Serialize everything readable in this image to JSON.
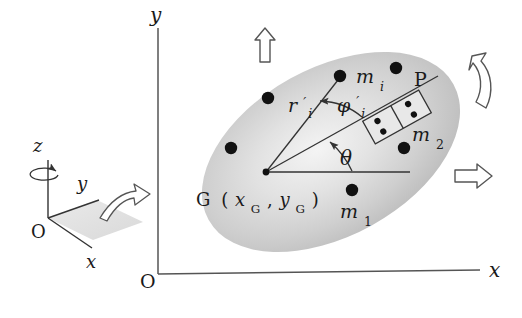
{
  "figure": {
    "background_color": "#ffffff",
    "line_color": "#333333",
    "body_fill_light": "#f2f2f2",
    "body_fill_dark": "#b4b4b4",
    "mass_dot_color": "#111111"
  },
  "global_frame": {
    "origin_label": "O",
    "x_axis_label": "x",
    "y_axis_label": "y"
  },
  "inset_frame": {
    "origin_label": "O",
    "x_axis_label": "x",
    "y_axis_label": "y",
    "z_axis_label": "z",
    "spin_icon": "rotation-ellipse-icon",
    "plane_arrow_icon": "curved-arrow-icon"
  },
  "body": {
    "center_label_name": "G",
    "center_label_open": "(",
    "center_coord_x": "x",
    "center_coord_x_sub": "G",
    "center_coord_sep": ",",
    "center_coord_y": "y",
    "center_coord_y_sub": "G",
    "center_label_close": ")"
  },
  "vectors": {
    "r_symbol": "r",
    "r_prime": "′",
    "r_sub": "i",
    "phi_symbol": "φ",
    "phi_prime": "′",
    "phi_sub": "i",
    "theta_symbol": "θ"
  },
  "masses": [
    {
      "name": "m-i",
      "symbol": "m",
      "sub": "i",
      "cx": 340,
      "cy": 76,
      "label_x": 356,
      "label_y": 78,
      "r": 6.2
    },
    {
      "name": "m-2",
      "symbol": "m",
      "sub": "2",
      "cx": 404,
      "cy": 148,
      "label_x": 412,
      "label_y": 138,
      "r": 6.2
    },
    {
      "name": "m-1",
      "symbol": "m",
      "sub": "1",
      "cx": 352,
      "cy": 190,
      "label_x": 342,
      "label_y": 215,
      "r": 6.2
    },
    {
      "name": "mass-dot-upper-left",
      "cx": 268,
      "cy": 98,
      "r": 6.2
    },
    {
      "name": "mass-dot-left",
      "cx": 231,
      "cy": 148,
      "r": 6.2
    },
    {
      "name": "mass-dot-top-right",
      "cx": 396,
      "cy": 68,
      "r": 6.2
    }
  ],
  "patch": {
    "label": "P",
    "label_x": 416,
    "label_y": 82,
    "electrode_dot_count": 4
  },
  "arrows": {
    "translation_up": "up-arrow",
    "translation_right": "right-arrow",
    "rotation_curved": "curved-rotation-arrow"
  }
}
